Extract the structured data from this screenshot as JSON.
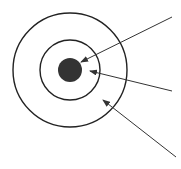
{
  "diagram": {
    "type": "concentric-circles-with-pointer-arrows",
    "colors": {
      "background": "#ffffff",
      "stroke": "#222222",
      "core_fill": "#333333",
      "arrow": "#333333"
    },
    "center": [
      70,
      70
    ],
    "circles": [
      {
        "name": "outer-ring",
        "r": 57,
        "filled": false
      },
      {
        "name": "inner-ring",
        "r": 30,
        "filled": false
      },
      {
        "name": "core",
        "r": 12,
        "filled": true
      }
    ],
    "arrows": [
      {
        "name": "arrow-to-core",
        "from": [
          172,
          17
        ],
        "to": [
          81,
          62
        ]
      },
      {
        "name": "arrow-to-inner-ring",
        "from": [
          172,
          91
        ],
        "to": [
          90,
          71
        ]
      },
      {
        "name": "arrow-to-outer-ring",
        "from": [
          176,
          157
        ],
        "to": [
          103,
          100
        ]
      }
    ],
    "labels": []
  }
}
